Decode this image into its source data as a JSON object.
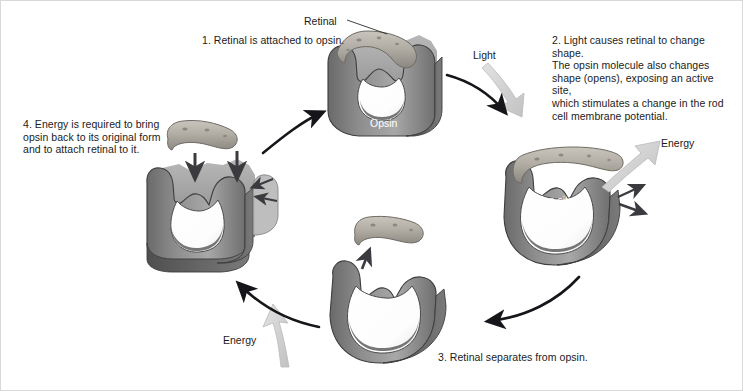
{
  "figure": {
    "background_color": "#ffffff",
    "border_color": "#d8d8d8"
  },
  "palette": {
    "protein_dark": "#5d5d5d",
    "protein_mid": "#7b7b7b",
    "protein_light": "#a5a5a5",
    "protein_highlight": "#c4c4c4",
    "retinal_fill": "#b4b0a8",
    "retinal_shadow": "#8d8a83",
    "arrow_black": "#15151a",
    "arrow_gray": "#cfcfcf",
    "cavity_white": "#ffffff",
    "text_dark": "#1b1b1b",
    "text_light": "#ffffff"
  },
  "steps": [
    {
      "number": "1",
      "caption": "1. Retinal is attached to opsin.",
      "position": "top-center"
    },
    {
      "number": "2",
      "caption": "2. Light causes retinal to change shape.\nThe opsin molecule also changes\nshape (opens), exposing an active site,\nwhich stimulates a change in the rod\ncell membrane potential.",
      "position": "right"
    },
    {
      "number": "3",
      "caption": "3. Retinal separates from opsin.",
      "position": "bottom-center"
    },
    {
      "number": "4",
      "caption": "4. Energy is required to bring\nopsin back to its original form\nand to attach retinal to it.",
      "position": "left"
    }
  ],
  "labels": {
    "retinal": "Retinal",
    "light": "Light",
    "energy_right": "Energy",
    "energy_bottom": "Energy",
    "opsin": "Opsin",
    "active_site": "Active site"
  },
  "cycle_arrows": [
    {
      "name": "step1-to-step2",
      "from": "1",
      "to": "2",
      "color": "#15151a",
      "style": "solid-black-curve"
    },
    {
      "name": "step2-to-step3",
      "from": "2",
      "to": "3",
      "color": "#15151a",
      "style": "solid-black-curve"
    },
    {
      "name": "step3-to-step4",
      "from": "3",
      "to": "4",
      "color": "#15151a",
      "style": "solid-black-curve"
    },
    {
      "name": "step4-to-step1",
      "from": "4",
      "to": "1",
      "color": "#15151a",
      "style": "solid-black-curve"
    }
  ],
  "input_arrows": [
    {
      "name": "light-arrow",
      "label": "Light",
      "color": "#cfcfcf",
      "direction": "down-right-into-step2"
    },
    {
      "name": "energy-release-arrow",
      "label": "Energy",
      "color": "#cfcfcf",
      "direction": "up-right-from-step2"
    },
    {
      "name": "energy-input-arrow",
      "label": "Energy",
      "color": "#cfcfcf",
      "direction": "up-into-step4"
    }
  ],
  "attach_arrows": [
    {
      "name": "retinal-attach-left",
      "color": "#3a3a3f",
      "direction": "down"
    },
    {
      "name": "retinal-attach-right",
      "color": "#3a3a3f",
      "direction": "down"
    },
    {
      "name": "retinal-release-arrow",
      "color": "#3a3a3f",
      "direction": "up"
    }
  ]
}
